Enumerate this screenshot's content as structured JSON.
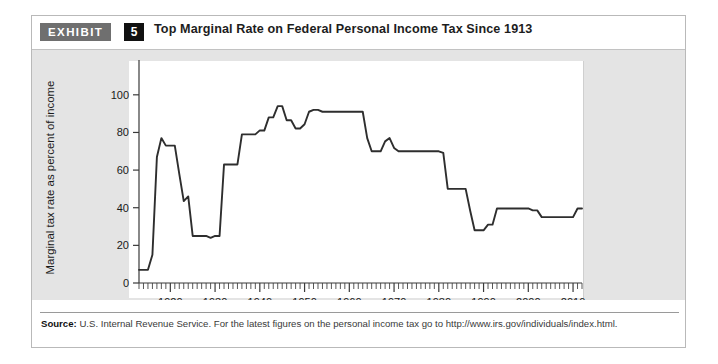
{
  "exhibit": {
    "tag_label": "EXHIBIT",
    "number": "5",
    "title": "Top Marginal Rate on Federal Personal Income Tax Since 1913"
  },
  "source": {
    "label": "Source:",
    "text": " U.S. Internal Revenue Service. For the latest figures on the personal income tax go to http://www.irs.gov/individuals/index.html."
  },
  "colors": {
    "band": "#e4e4e4",
    "panel": "#ffffff",
    "line": "#2e2e2e",
    "tag": "#6f6f6f",
    "number_box": "#111111"
  },
  "chart_data": {
    "type": "line",
    "title": "Top Marginal Rate on Federal Personal Income Tax Since 1913",
    "xlabel": "",
    "ylabel": "Marginal tax rate as percent of income",
    "xlim": [
      1913,
      2012
    ],
    "ylim": [
      0,
      110
    ],
    "grid": false,
    "legend": "none",
    "y_ticks": [
      0,
      20,
      40,
      60,
      80,
      100
    ],
    "x_ticks": [
      1920,
      1930,
      1940,
      1950,
      1960,
      1970,
      1980,
      1990,
      2000,
      2010
    ],
    "x_minor_tick_interval": 1,
    "series": [
      {
        "name": "Top marginal tax rate",
        "x": [
          1913,
          1914,
          1915,
          1916,
          1917,
          1918,
          1919,
          1920,
          1921,
          1922,
          1923,
          1924,
          1925,
          1926,
          1927,
          1928,
          1929,
          1930,
          1931,
          1932,
          1933,
          1934,
          1935,
          1936,
          1937,
          1938,
          1939,
          1940,
          1941,
          1942,
          1943,
          1944,
          1945,
          1946,
          1947,
          1948,
          1949,
          1950,
          1951,
          1952,
          1953,
          1954,
          1955,
          1956,
          1957,
          1958,
          1959,
          1960,
          1961,
          1962,
          1963,
          1964,
          1965,
          1966,
          1967,
          1968,
          1969,
          1970,
          1971,
          1972,
          1973,
          1974,
          1975,
          1976,
          1977,
          1978,
          1979,
          1980,
          1981,
          1982,
          1983,
          1984,
          1985,
          1986,
          1987,
          1988,
          1989,
          1990,
          1991,
          1992,
          1993,
          1994,
          1995,
          1996,
          1997,
          1998,
          1999,
          2000,
          2001,
          2002,
          2003,
          2004,
          2005,
          2006,
          2007,
          2008,
          2009,
          2010,
          2011,
          2012
        ],
        "values": [
          7,
          7,
          7,
          15,
          67,
          77,
          73,
          73,
          73,
          58,
          43.5,
          46,
          25,
          25,
          25,
          25,
          24,
          25,
          25,
          63,
          63,
          63,
          63,
          79,
          79,
          79,
          79,
          81.1,
          81,
          88,
          88,
          94,
          94,
          86.45,
          86.45,
          82.13,
          82.13,
          84.36,
          91,
          92,
          92,
          91,
          91,
          91,
          91,
          91,
          91,
          91,
          91,
          91,
          91,
          77,
          70,
          70,
          70,
          75.25,
          77,
          71.75,
          70,
          70,
          70,
          70,
          70,
          70,
          70,
          70,
          70,
          70,
          69.125,
          50,
          50,
          50,
          50,
          50,
          38.5,
          28,
          28,
          28,
          31,
          31,
          39.6,
          39.6,
          39.6,
          39.6,
          39.6,
          39.6,
          39.6,
          39.6,
          38.6,
          38.6,
          35,
          35,
          35,
          35,
          35,
          35,
          35,
          35,
          39.6,
          39.6
        ]
      }
    ]
  }
}
